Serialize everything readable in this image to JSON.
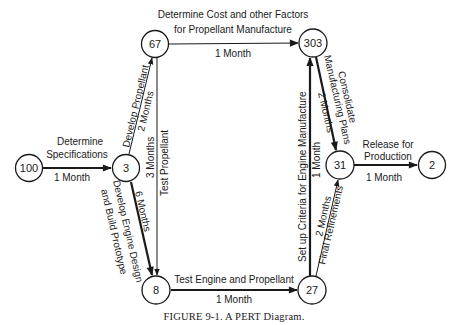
{
  "figure": {
    "caption": "FIGURE 9-1. A PERT Diagram.",
    "nodes": [
      {
        "id": "100",
        "label": "100"
      },
      {
        "id": "3",
        "label": "3"
      },
      {
        "id": "67",
        "label": "67"
      },
      {
        "id": "303",
        "label": "303"
      },
      {
        "id": "8",
        "label": "8"
      },
      {
        "id": "27",
        "label": "27"
      },
      {
        "id": "31",
        "label": "31"
      },
      {
        "id": "2",
        "label": "2"
      }
    ],
    "edges": {
      "e100_3": {
        "from": "100",
        "to": "3",
        "activity_line1": "Determine",
        "activity_line2": "Specifications",
        "duration": "1 Month",
        "critical": true
      },
      "e3_67": {
        "from": "3",
        "to": "67",
        "activity": "Develop Propellant",
        "duration": "2 Months",
        "critical": false
      },
      "e67_303": {
        "from": "67",
        "to": "303",
        "activity_line1": "Determine Cost and other Factors",
        "activity_line2": "for Propellant Manufacture",
        "duration": "1 Month",
        "critical": false
      },
      "e67_8": {
        "from": "67",
        "to": "8",
        "activity": "Test Propellant",
        "duration": "3 Months",
        "critical": false
      },
      "e3_8": {
        "from": "3",
        "to": "8",
        "activity_line1": "Develop Engine Design",
        "activity_line2": "and Build Prototype",
        "duration": "6 Months",
        "critical": true
      },
      "e8_27": {
        "from": "8",
        "to": "27",
        "activity": "Test Engine and Propellant",
        "duration": "1 Month",
        "critical": true
      },
      "e27_303": {
        "from": "27",
        "to": "303",
        "activity": "Set up Criteria for Engine Manufacture",
        "duration": "1 Month",
        "critical": true
      },
      "e303_31": {
        "from": "303",
        "to": "31",
        "activity_line1": "Consolidate",
        "activity_line2": "Manufacturing Plans",
        "duration": "2 Months",
        "critical": true
      },
      "e27_31": {
        "from": "27",
        "to": "31",
        "activity": "Final Refinements",
        "duration": "2 Months",
        "critical": false
      },
      "e31_2": {
        "from": "31",
        "to": "2",
        "activity_line1": "Release for",
        "activity_line2": "Production",
        "duration": "1 Month",
        "critical": true
      }
    }
  }
}
